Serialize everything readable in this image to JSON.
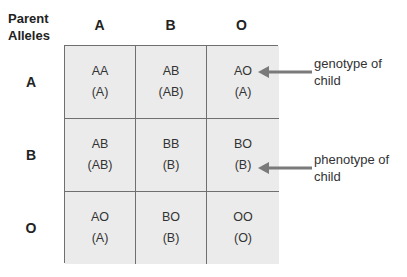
{
  "title": "Parent Alleles",
  "corner_label": [
    "Parent",
    "Alleles"
  ],
  "columns": [
    "A",
    "B",
    "O"
  ],
  "rows": [
    "A",
    "B",
    "O"
  ],
  "cells": [
    [
      {
        "genotype": "AA",
        "phenotype": "(A)"
      },
      {
        "genotype": "AB",
        "phenotype": "(AB)"
      },
      {
        "genotype": "AO",
        "phenotype": "(A)"
      }
    ],
    [
      {
        "genotype": "AB",
        "phenotype": "(AB)"
      },
      {
        "genotype": "BB",
        "phenotype": "(B)"
      },
      {
        "genotype": "BO",
        "phenotype": "(B)"
      }
    ],
    [
      {
        "genotype": "AO",
        "phenotype": "(A)"
      },
      {
        "genotype": "BO",
        "phenotype": "(B)"
      },
      {
        "genotype": "OO",
        "phenotype": "(O)"
      }
    ]
  ],
  "annotations": [
    {
      "line1": "genotype of",
      "line2": "child",
      "points_to": "row A, col O genotype"
    },
    {
      "line1": "phenotype of",
      "line2": "child",
      "points_to": "row B, col O phenotype"
    }
  ],
  "colors": {
    "grid_line": "#6f6f6f",
    "cell_fill": "#ebebeb",
    "arrow": "#7a7a7a",
    "text": "#222222"
  }
}
